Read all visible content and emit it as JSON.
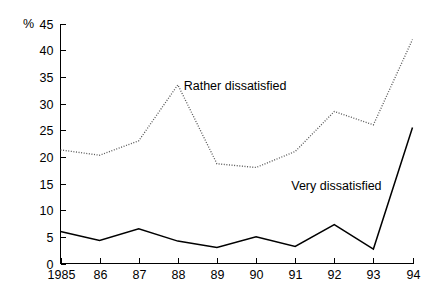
{
  "chart_data": {
    "type": "line",
    "title": "",
    "xlabel": "",
    "ylabel": "%",
    "unit_label": "%",
    "categories": [
      "1985",
      "86",
      "87",
      "88",
      "89",
      "90",
      "91",
      "92",
      "93",
      "94"
    ],
    "x": [
      1985,
      1986,
      1987,
      1988,
      1989,
      1990,
      1991,
      1992,
      1993,
      1994
    ],
    "series": [
      {
        "name": "Rather dissatisfied",
        "style": "dotted",
        "values": [
          21.3,
          20.3,
          23.0,
          33.5,
          18.7,
          18.0,
          21.0,
          28.5,
          26.0,
          42.0
        ]
      },
      {
        "name": "Very dissatisfied",
        "style": "solid",
        "values": [
          6.0,
          4.3,
          6.5,
          4.2,
          3.0,
          5.0,
          3.2,
          7.3,
          2.7,
          25.5
        ]
      }
    ],
    "ylim": [
      0,
      45
    ],
    "xlim": [
      1985,
      1994
    ],
    "yticks": [
      0,
      5,
      10,
      15,
      20,
      25,
      30,
      35,
      40,
      45
    ],
    "ytick_labels": [
      "0",
      "5",
      "10",
      "15",
      "20",
      "25",
      "30",
      "35",
      "40",
      "45"
    ],
    "xtick_labels": [
      "1985",
      "86",
      "87",
      "88",
      "89",
      "90",
      "91",
      "92",
      "93",
      "94"
    ],
    "grid": false,
    "legend": "inline-annotations",
    "annotations": [
      {
        "text": "Rather dissatisfied",
        "x": 1988.15,
        "y": 32.5
      },
      {
        "text": "Very dissatisfied",
        "x": 1990.9,
        "y": 13.8
      }
    ],
    "colors": {
      "axis": "#000000",
      "solid_series": "#000000",
      "dotted_series": "#555555",
      "background": "#ffffff"
    }
  }
}
